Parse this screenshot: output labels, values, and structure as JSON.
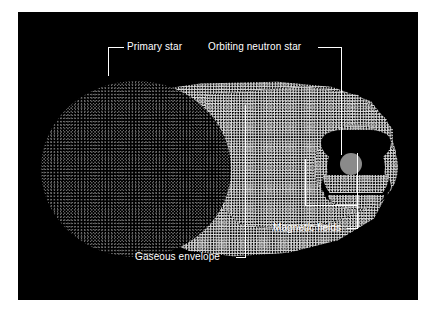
{
  "figure": {
    "background_color": "#ffffff",
    "plate_color": "#000000",
    "label_color": "#ffffff",
    "neutron_star_color": "#8a8a8a",
    "width": 435,
    "height": 313
  },
  "labels": {
    "primary_star": "Primary star",
    "orbiting_neutron_star": "Orbiting neutron star",
    "gaseous_envelope": "Gaseous envelope",
    "magnetic_fields": "Magnetic fields"
  },
  "components": {
    "primary_star": {
      "name": "Primary star",
      "description": "large stippled dark-gray sphere at left",
      "tone": "dark stipple"
    },
    "gaseous_envelope": {
      "name": "Gaseous envelope",
      "description": "bright stippled cone of gas streaming from the primary star toward the neutron star",
      "tone": "bright stipple"
    },
    "accretion_disk": {
      "name": "Accretion torus",
      "description": "bright stippled ring encircling the neutron star",
      "tone": "bright stipple"
    },
    "neutron_star": {
      "name": "Orbiting neutron star",
      "description": "small solid gray disk at the center of the torus",
      "tone": "solid gray"
    },
    "magnetic_fields": {
      "name": "Magnetic fields",
      "description": "dark bow-tie shaped cavities above and below the neutron star carved out of the torus",
      "tone": "black"
    }
  }
}
